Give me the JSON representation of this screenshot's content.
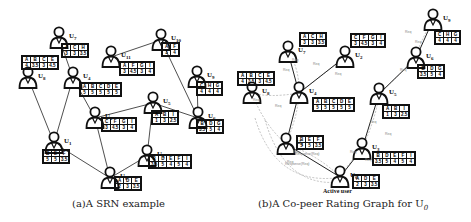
{
  "panel_a": {
    "caption": "(a)A SRN example",
    "users": [
      {
        "id": "U7",
        "label": "U",
        "sub": "7",
        "x": 48,
        "y": 26,
        "table": {
          "x": 62,
          "y": 44,
          "items": [
            "A",
            "C",
            "H"
          ],
          "ratings": [
            "3",
            "3",
            "3.5"
          ]
        }
      },
      {
        "id": "U8",
        "label": "U",
        "sub": "8",
        "x": 17,
        "y": 66,
        "table": {
          "x": 22,
          "y": 56,
          "items": [
            "A",
            "B",
            "C",
            "E"
          ],
          "ratings": [
            "4",
            "3.5",
            "3",
            "4.5"
          ]
        }
      },
      {
        "id": "U4",
        "label": "U",
        "sub": "4",
        "x": 62,
        "y": 66,
        "table": {
          "x": 80,
          "y": 83,
          "items": [
            "A",
            "B",
            "C",
            "D",
            "E"
          ],
          "ratings": [
            "5",
            "5",
            "5",
            "5",
            "5"
          ]
        }
      },
      {
        "id": "U11",
        "label": "U",
        "sub": "11",
        "x": 100,
        "y": 45,
        "table": {
          "x": 120,
          "y": 62,
          "items": [
            "A",
            "F",
            "G",
            "I"
          ],
          "ratings": [
            "3",
            "4.5",
            "3",
            "4"
          ]
        }
      },
      {
        "id": "U10",
        "label": "U",
        "sub": "10",
        "x": 150,
        "y": 28,
        "table": {
          "x": 162,
          "y": 43,
          "items": [
            "A",
            "F"
          ],
          "ratings": [
            "3",
            "4"
          ]
        }
      },
      {
        "id": "U9",
        "label": "U",
        "sub": "9",
        "x": 186,
        "y": 65,
        "table": {
          "x": 197,
          "y": 82,
          "items": [
            "C",
            "H",
            "G"
          ],
          "ratings": [
            "4",
            "4",
            "4"
          ]
        }
      },
      {
        "id": "U2",
        "label": "U",
        "sub": "2",
        "x": 84,
        "y": 106,
        "table": {
          "x": 102,
          "y": 118,
          "items": [
            "C",
            "F",
            "G",
            "I"
          ],
          "ratings": [
            "3",
            "4.5",
            "3",
            "4"
          ]
        }
      },
      {
        "id": "U5",
        "label": "U",
        "sub": "5",
        "x": 142,
        "y": 91,
        "table": {
          "x": 152,
          "y": 111,
          "items": [
            "A",
            "B",
            "I"
          ],
          "ratings": [
            "1",
            "3",
            "2.5"
          ]
        }
      },
      {
        "id": "U6",
        "label": "U",
        "sub": "6",
        "x": 187,
        "y": 106,
        "table": {
          "x": 197,
          "y": 120,
          "items": [
            "B",
            "D",
            "G"
          ],
          "ratings": [
            "3.5",
            "5",
            "4"
          ]
        }
      },
      {
        "id": "U1",
        "label": "U",
        "sub": "1",
        "x": 43,
        "y": 131,
        "table": {
          "x": 43,
          "y": 150,
          "items": [
            "B",
            "E",
            "F"
          ],
          "ratings": [
            "5",
            "5",
            "3.5"
          ]
        }
      },
      {
        "id": "U3",
        "label": "U",
        "sub": "3",
        "x": 136,
        "y": 144,
        "table": {
          "x": 149,
          "y": 155,
          "items": [
            "B",
            "D",
            "E",
            "F",
            "I"
          ],
          "ratings": [
            "3.5",
            "5",
            "4",
            "5",
            "4"
          ]
        }
      },
      {
        "id": "U0",
        "label": "U",
        "sub": "0",
        "x": 99,
        "y": 166,
        "table": {
          "x": 115,
          "y": 177,
          "items": [
            "A",
            "D",
            "E"
          ],
          "ratings": [
            "2",
            "3",
            "3.5"
          ]
        }
      }
    ],
    "edges": [
      [
        "U7",
        "U4"
      ],
      [
        "U8",
        "U1"
      ],
      [
        "U4",
        "U1"
      ],
      [
        "U4",
        "U2"
      ],
      [
        "U11",
        "U10"
      ],
      [
        "U10",
        "U6"
      ],
      [
        "U9",
        "U6"
      ],
      [
        "U2",
        "U5"
      ],
      [
        "U2",
        "U0"
      ],
      [
        "U5",
        "U6"
      ],
      [
        "U5",
        "U3"
      ],
      [
        "U1",
        "U0"
      ],
      [
        "U3",
        "U0"
      ]
    ]
  },
  "panel_b": {
    "caption": "(b)A Co-peer Rating Graph for U",
    "caption_sub": "0",
    "active_user_label": "Active user",
    "users": [
      {
        "id": "U7",
        "label": "U",
        "sub": "7",
        "x": 42,
        "y": 40,
        "table": {
          "x": 65,
          "y": 33,
          "items": [
            "A",
            "C",
            "H"
          ],
          "ratings": [
            "3",
            "3",
            "3.5"
          ]
        }
      },
      {
        "id": "U2",
        "label": "U",
        "sub": "2",
        "x": 99,
        "y": 45,
        "table": {
          "x": 116,
          "y": 34,
          "items": [
            "C",
            "F",
            "G",
            "I"
          ],
          "ratings": [
            "3",
            "4.5",
            "3",
            "4"
          ]
        }
      },
      {
        "id": "U9",
        "label": "U",
        "sub": "9",
        "x": 187,
        "y": 8,
        "table": {
          "x": 200,
          "y": 31,
          "items": [
            "C",
            "H",
            "G"
          ],
          "ratings": [
            "4",
            "4",
            "4"
          ]
        }
      },
      {
        "id": "U8",
        "label": "U",
        "sub": "8",
        "x": 6,
        "y": 81,
        "table": {
          "x": 3,
          "y": 72,
          "items": [
            "A",
            "B",
            "C",
            "E"
          ],
          "ratings": [
            "4",
            "3.5",
            "3",
            "4.5"
          ]
        }
      },
      {
        "id": "U4",
        "label": "U",
        "sub": "4",
        "x": 53,
        "y": 81,
        "table": {
          "x": 78,
          "y": 98,
          "items": [
            "A",
            "B",
            "C",
            "D",
            "E"
          ],
          "ratings": [
            "5",
            "5",
            "5",
            "5",
            "5"
          ]
        }
      },
      {
        "id": "U6",
        "label": "U",
        "sub": "6",
        "x": 170,
        "y": 46,
        "table": {
          "x": 183,
          "y": 65,
          "items": [
            "B",
            "D",
            "G"
          ],
          "ratings": [
            "3.5",
            "5",
            "4"
          ]
        }
      },
      {
        "id": "U5",
        "label": "U",
        "sub": "5",
        "x": 133,
        "y": 82,
        "table": {
          "x": 148,
          "y": 105,
          "items": [
            "A",
            "B",
            "I"
          ],
          "ratings": [
            "1",
            "3",
            "2.5"
          ]
        }
      },
      {
        "id": "U1",
        "label": "U",
        "sub": "1",
        "x": 40,
        "y": 132,
        "table": {
          "x": 62,
          "y": 136,
          "items": [
            "B",
            "E",
            "F"
          ],
          "ratings": [
            "5",
            "5",
            "3.5"
          ]
        }
      },
      {
        "id": "U3",
        "label": "U",
        "sub": "3",
        "x": 116,
        "y": 137,
        "table": {
          "x": 138,
          "y": 152,
          "items": [
            "B",
            "D",
            "E",
            "F",
            "I"
          ],
          "ratings": [
            "3.5",
            "5",
            "4",
            "5",
            "4"
          ]
        }
      },
      {
        "id": "U0",
        "label": "U",
        "sub": "0",
        "x": 94,
        "y": 165,
        "table": {
          "x": 118,
          "y": 175,
          "items": [
            "A",
            "D",
            "E"
          ],
          "ratings": [
            "2",
            "3",
            "3.5"
          ]
        }
      }
    ],
    "solid_edges": [
      [
        "U7",
        "U4"
      ],
      [
        "U4",
        "U2"
      ],
      [
        "U4",
        "U1"
      ],
      [
        "U9",
        "U6"
      ],
      [
        "U6",
        "U5"
      ],
      [
        "U5",
        "U3"
      ],
      [
        "U1",
        "U0"
      ],
      [
        "U3",
        "U0"
      ]
    ],
    "edge_labels": [
      "Req",
      "Req",
      "Req",
      "Req",
      "Req",
      "Req",
      "Req",
      "Req",
      "Req",
      "Req",
      "Req",
      "Req",
      "Req",
      "Req",
      "Req",
      "Req",
      "Req",
      "Req",
      "Response(Req)",
      "Response(Req)"
    ]
  }
}
